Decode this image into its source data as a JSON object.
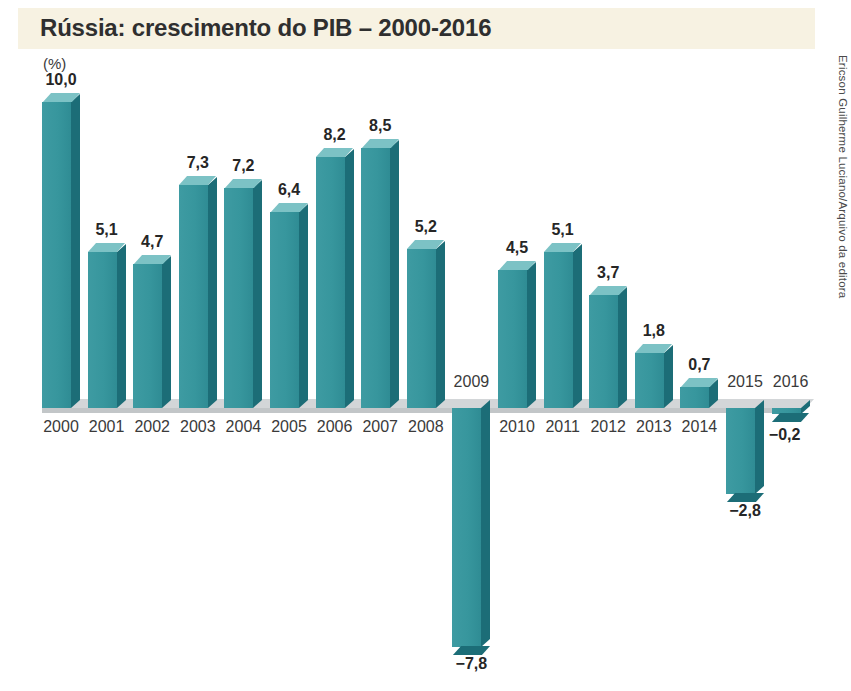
{
  "title": "Rússia: crescimento do PIB – 2000-2016",
  "unit_label": "(%)",
  "credit": "Ericson Guilherme Luciano/Arquivo da editora",
  "colors": {
    "title_band": "#f7f2e2",
    "bar_front": "#37969d",
    "bar_side": "#1c6d77",
    "bar_top": "#7cc2c5",
    "baseline": "#d3d6d8",
    "background": "#ffffff",
    "text": "#2b2b2b"
  },
  "chart_data": {
    "type": "bar",
    "title": "Rússia: crescimento do PIB – 2000-2016",
    "xlabel": "",
    "ylabel": "(%)",
    "ylim": [
      -8.5,
      10.5
    ],
    "grid": false,
    "legend": false,
    "categories": [
      "2000",
      "2001",
      "2002",
      "2003",
      "2004",
      "2005",
      "2006",
      "2007",
      "2008",
      "2009",
      "2010",
      "2011",
      "2012",
      "2013",
      "2014",
      "2015",
      "2016"
    ],
    "values": [
      10.0,
      5.1,
      4.7,
      7.3,
      7.2,
      6.4,
      8.2,
      8.5,
      5.2,
      -7.8,
      4.5,
      5.1,
      3.7,
      1.8,
      0.7,
      -2.8,
      -0.2
    ],
    "value_labels": [
      "10,0",
      "5,1",
      "4,7",
      "7,3",
      "7,2",
      "6,4",
      "8,2",
      "8,5",
      "5,2",
      "−7,8",
      "4,5",
      "5,1",
      "3,7",
      "1,8",
      "0,7",
      "−2,8",
      "−0,2"
    ]
  }
}
